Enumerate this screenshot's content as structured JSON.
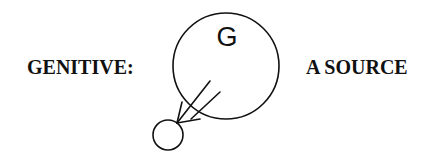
{
  "diagram": {
    "left_label": "GENITIVE:",
    "right_label": "A SOURCE",
    "large_node": {
      "label": "G",
      "shape": "circle",
      "center": [
        226,
        66
      ],
      "radius": 53
    },
    "small_node": {
      "label": "",
      "shape": "circle",
      "center": [
        168,
        135
      ],
      "radius": 15
    },
    "arrow": {
      "style": "double-line",
      "direction": "from large circle interior to small circle",
      "color": "#111111"
    },
    "stroke_color": "#111111",
    "background": "#ffffff"
  }
}
